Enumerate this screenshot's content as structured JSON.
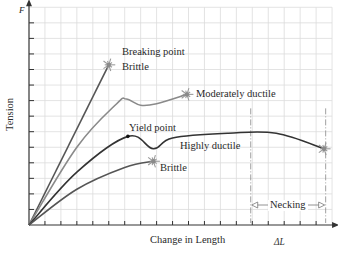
{
  "chart_data": {
    "type": "line",
    "title": "",
    "xlabel": "Change in Length",
    "ylabel": "Tension",
    "x_symbol": "ΔL",
    "y_symbol": "F",
    "grid": true,
    "xlim": [
      0,
      19
    ],
    "ylim": [
      0,
      14
    ],
    "series": [
      {
        "name": "Brittle (high strength)",
        "label": "Breaking point\nBrittle",
        "color": "#555555",
        "points": [
          [
            0,
            0
          ],
          [
            5,
            10.3
          ]
        ],
        "end": "break"
      },
      {
        "name": "Moderately ductile",
        "label": "Moderately ductile",
        "color": "#8a8a8a",
        "points": [
          [
            0,
            0
          ],
          [
            3,
            5
          ],
          [
            5.5,
            7.8
          ],
          [
            6.1,
            8.1
          ],
          [
            7,
            7.7
          ],
          [
            8,
            7.8
          ],
          [
            9.9,
            8.4
          ]
        ],
        "end": "break"
      },
      {
        "name": "Highly ductile",
        "label": "Highly ductile",
        "color": "#333333",
        "points": [
          [
            0,
            0
          ],
          [
            3,
            3.4
          ],
          [
            6.2,
            5.7
          ],
          [
            7.8,
            4.9
          ],
          [
            9,
            5.6
          ],
          [
            12.5,
            5.9
          ],
          [
            15.5,
            5.9
          ],
          [
            18.5,
            4.9
          ]
        ],
        "end": "break",
        "annotations": [
          {
            "text": "Yield point",
            "at": [
              6.2,
              5.7
            ]
          }
        ]
      },
      {
        "name": "Brittle (low strength)",
        "label": "Brittle",
        "color": "#555555",
        "points": [
          [
            0,
            0
          ],
          [
            3,
            2.3
          ],
          [
            6,
            3.7
          ],
          [
            7.8,
            4.1
          ]
        ],
        "end": "break"
      }
    ],
    "annotations": [
      {
        "text": "Necking",
        "type": "range",
        "x_from": 13.9,
        "x_to": 18.6
      }
    ]
  },
  "labels": {
    "y_symbol": "F",
    "y_axis": "Tension",
    "x_axis": "Change in Length",
    "x_symbol": "ΔL",
    "breaking_point": "Breaking point",
    "brittle_top": "Brittle",
    "moderately_ductile": "Moderately ductile",
    "yield_point": "Yield point",
    "highly_ductile": "Highly ductile",
    "brittle_bottom": "Brittle",
    "necking": "Necking"
  }
}
